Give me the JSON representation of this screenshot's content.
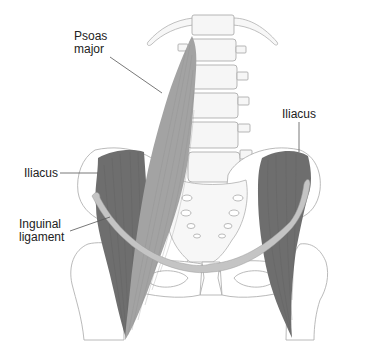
{
  "diagram": {
    "labels": {
      "psoas_major_line1": "Psoas",
      "psoas_major_line2": "major",
      "iliacus_right": "Iliacus",
      "iliacus_left": "Iliacus",
      "inguinal_line1": "Inguinal",
      "inguinal_line2": "ligament"
    },
    "colors": {
      "background": "#ffffff",
      "psoas_fill": "#a3a3a3",
      "iliacus_fill": "#6e6e6e",
      "ligament_fill": "#c4c4c4",
      "bone_fill": "#f6f6f6",
      "bone_outline": "#a8a8a8",
      "label_text": "#222222",
      "leader_line": "#555555"
    }
  }
}
